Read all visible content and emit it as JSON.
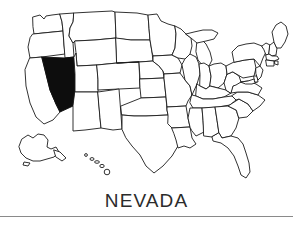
{
  "figure": {
    "kind": "choropleth-locator-map",
    "region": "United States of America",
    "projection_note": "Alaska and Hawaii shown as insets at lower left",
    "caption": "NEVADA",
    "highlighted_state": "Nevada",
    "colors": {
      "highlight_fill": "#0d0d0d",
      "state_fill": "#ffffff",
      "border_stroke": "#1b1b1b",
      "caption_text": "#2b2b2b",
      "rule": "#8a8a8a",
      "background": "#ffffff"
    }
  },
  "map_data": {
    "type": "map",
    "title": "NEVADA",
    "legend": [],
    "highlighted": [
      "Nevada"
    ],
    "states": [
      {
        "name": "Washington",
        "highlighted": false
      },
      {
        "name": "Oregon",
        "highlighted": false
      },
      {
        "name": "California",
        "highlighted": false
      },
      {
        "name": "Nevada",
        "highlighted": true
      },
      {
        "name": "Idaho",
        "highlighted": false
      },
      {
        "name": "Montana",
        "highlighted": false
      },
      {
        "name": "Wyoming",
        "highlighted": false
      },
      {
        "name": "Utah",
        "highlighted": false
      },
      {
        "name": "Arizona",
        "highlighted": false
      },
      {
        "name": "Colorado",
        "highlighted": false
      },
      {
        "name": "New Mexico",
        "highlighted": false
      },
      {
        "name": "North Dakota",
        "highlighted": false
      },
      {
        "name": "South Dakota",
        "highlighted": false
      },
      {
        "name": "Nebraska",
        "highlighted": false
      },
      {
        "name": "Kansas",
        "highlighted": false
      },
      {
        "name": "Oklahoma",
        "highlighted": false
      },
      {
        "name": "Texas",
        "highlighted": false
      },
      {
        "name": "Minnesota",
        "highlighted": false
      },
      {
        "name": "Iowa",
        "highlighted": false
      },
      {
        "name": "Missouri",
        "highlighted": false
      },
      {
        "name": "Arkansas",
        "highlighted": false
      },
      {
        "name": "Louisiana",
        "highlighted": false
      },
      {
        "name": "Wisconsin",
        "highlighted": false
      },
      {
        "name": "Illinois",
        "highlighted": false
      },
      {
        "name": "Michigan",
        "highlighted": false
      },
      {
        "name": "Indiana",
        "highlighted": false
      },
      {
        "name": "Ohio",
        "highlighted": false
      },
      {
        "name": "Kentucky",
        "highlighted": false
      },
      {
        "name": "Tennessee",
        "highlighted": false
      },
      {
        "name": "Mississippi",
        "highlighted": false
      },
      {
        "name": "Alabama",
        "highlighted": false
      },
      {
        "name": "Georgia",
        "highlighted": false
      },
      {
        "name": "Florida",
        "highlighted": false
      },
      {
        "name": "South Carolina",
        "highlighted": false
      },
      {
        "name": "North Carolina",
        "highlighted": false
      },
      {
        "name": "Virginia",
        "highlighted": false
      },
      {
        "name": "West Virginia",
        "highlighted": false
      },
      {
        "name": "Maryland",
        "highlighted": false
      },
      {
        "name": "Delaware",
        "highlighted": false
      },
      {
        "name": "Pennsylvania",
        "highlighted": false
      },
      {
        "name": "New Jersey",
        "highlighted": false
      },
      {
        "name": "New York",
        "highlighted": false
      },
      {
        "name": "Connecticut",
        "highlighted": false
      },
      {
        "name": "Rhode Island",
        "highlighted": false
      },
      {
        "name": "Massachusetts",
        "highlighted": false
      },
      {
        "name": "Vermont",
        "highlighted": false
      },
      {
        "name": "New Hampshire",
        "highlighted": false
      },
      {
        "name": "Maine",
        "highlighted": false
      },
      {
        "name": "Alaska",
        "highlighted": false
      },
      {
        "name": "Hawaii",
        "highlighted": false
      }
    ]
  }
}
